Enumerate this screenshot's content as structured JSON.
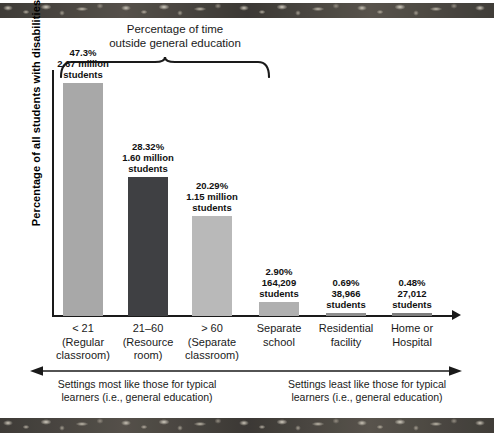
{
  "chart_data": {
    "type": "bar",
    "title": "Percentage of time outside general education",
    "xlabel": "",
    "ylabel": "Percentage of all students with disabilities",
    "ylim": [
      0,
      50
    ],
    "grid": false,
    "legend": "none",
    "categories": [
      "< 21 (Regular classroom)",
      "21–60 (Resource room)",
      "> 60 (Separate classroom)",
      "Separate school",
      "Residential facility",
      "Home or Hospital"
    ],
    "values": [
      47.3,
      28.32,
      20.29,
      2.9,
      0.69,
      0.48
    ],
    "counts": [
      "2.67 million students",
      "1.60 million students",
      "1.15 million students",
      "164,209 students",
      "38,966 students",
      "27,012 students"
    ],
    "bar_colors": [
      "#a8a8a8",
      "#3f4043",
      "#b9b9b9",
      "#b0b0b0",
      "#8e8e8e",
      "#7e7e7e"
    ]
  },
  "header": {
    "title_line1": "Percentage of time",
    "title_line2": "outside general education"
  },
  "axis": {
    "ylabel": "Percentage of all students with disabilities"
  },
  "bars": [
    {
      "pct": "47.3%",
      "count_line1": "2.67 million",
      "count_line2": "students"
    },
    {
      "pct": "28.32%",
      "count_line1": "1.60 million",
      "count_line2": "students"
    },
    {
      "pct": "20.29%",
      "count_line1": "1.15 million",
      "count_line2": "students"
    },
    {
      "pct": "2.90%",
      "count_line1": "164,209",
      "count_line2": "students"
    },
    {
      "pct": "0.69%",
      "count_line1": "38,966",
      "count_line2": "students"
    },
    {
      "pct": "0.48%",
      "count_line1": "27,012",
      "count_line2": "students"
    }
  ],
  "categories": [
    {
      "line1": "< 21",
      "line2": "(Regular",
      "line3": "classroom)"
    },
    {
      "line1": "21–60",
      "line2": "(Resource",
      "line3": "room)"
    },
    {
      "line1": "> 60",
      "line2": "(Separate",
      "line3": "classroom)"
    },
    {
      "line1": "Separate",
      "line2": "school",
      "line3": ""
    },
    {
      "line1": "Residential",
      "line2": "facility",
      "line3": ""
    },
    {
      "line1": "Home or",
      "line2": "Hospital",
      "line3": ""
    }
  ],
  "footer": {
    "left_line1": "Settings most like those for typical",
    "left_line2": "learners (i.e., general education)",
    "right_line1": "Settings least like those for typical",
    "right_line2": "learners (i.e., general education)"
  }
}
